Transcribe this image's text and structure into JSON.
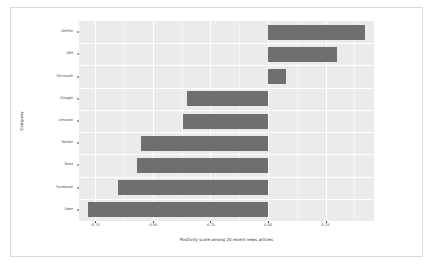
{
  "chart_data": {
    "type": "bar",
    "orientation": "horizontal",
    "title": "",
    "xlabel": "Positivity score among 20 recent news articles",
    "ylabel": "Company",
    "categories": [
      "Netflix",
      "IBM",
      "Microsoft",
      "Google",
      "Amazon",
      "Twitter",
      "Tesla",
      "Facebook",
      "Uber"
    ],
    "values": [
      0.42,
      0.3,
      0.08,
      -0.35,
      -0.37,
      -0.55,
      -0.57,
      -0.65,
      -0.78
    ],
    "xlim": [
      -0.82,
      0.46
    ],
    "xticks": [
      -0.75,
      -0.5,
      -0.25,
      0.0,
      0.25
    ],
    "xticklabels": [
      "-0.75",
      "-0.50",
      "-0.25",
      "0.00",
      "0.25"
    ],
    "bar_color": "#6f6f6f",
    "panel_color": "#ebebeb",
    "grid": true,
    "grid_color": "#ffffff",
    "legend": false
  },
  "axis": {
    "x_title": "Positivity score among 20 recent news articles",
    "y_title": "Company"
  },
  "ticks": {
    "x": [
      {
        "label": "-0.75",
        "value": -0.75
      },
      {
        "label": "-0.50",
        "value": -0.5
      },
      {
        "label": "-0.25",
        "value": -0.25
      },
      {
        "label": "0.00",
        "value": 0.0
      },
      {
        "label": "0.25",
        "value": 0.25
      }
    ],
    "y": [
      {
        "label": "Netflix"
      },
      {
        "label": "IBM"
      },
      {
        "label": "Microsoft"
      },
      {
        "label": "Google"
      },
      {
        "label": "Amazon"
      },
      {
        "label": "Twitter"
      },
      {
        "label": "Tesla"
      },
      {
        "label": "Facebook"
      },
      {
        "label": "Uber"
      }
    ]
  }
}
